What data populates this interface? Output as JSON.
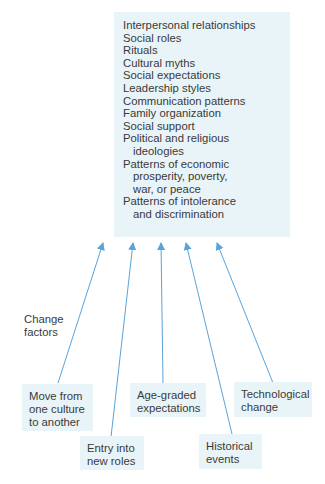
{
  "diagram": {
    "target_box": {
      "items": [
        {
          "line1": "Interpersonal relationships"
        },
        {
          "line1": "Social roles"
        },
        {
          "line1": "Rituals"
        },
        {
          "line1": "Cultural myths"
        },
        {
          "line1": "Social expectations"
        },
        {
          "line1": "Leadership styles"
        },
        {
          "line1": "Communication patterns"
        },
        {
          "line1": "Family organization"
        },
        {
          "line1": "Social support"
        },
        {
          "line1": "Political and religious",
          "line2": "ideologies"
        },
        {
          "line1": "Patterns of economic",
          "line2": "prosperity, poverty,",
          "line3": "war, or peace"
        },
        {
          "line1": "Patterns of intolerance",
          "line2": "and discrimination"
        }
      ]
    },
    "side_label": {
      "line1": "Change",
      "line2": "factors"
    },
    "factors": [
      {
        "line1": "Move from",
        "line2": "one culture",
        "line3": "to another"
      },
      {
        "line1": "Entry into",
        "line2": "new roles"
      },
      {
        "line1": "Age-graded",
        "line2": "expectations"
      },
      {
        "line1": "Historical",
        "line2": "events"
      },
      {
        "line1": "Technological",
        "line2": "change"
      }
    ],
    "colors": {
      "box_fill": "#e9f4f8",
      "arrow": "#5aa3d8",
      "text": "#3a3a3a"
    }
  }
}
